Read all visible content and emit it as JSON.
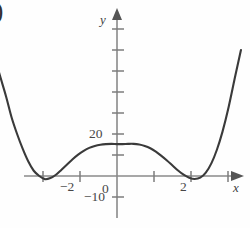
{
  "figure": {
    "paren_mark": ")",
    "background_color": "#fefefe",
    "curve_color": "#3a3a3a",
    "axis_color": "#8a8a8a",
    "text_color": "#474747"
  },
  "axes": {
    "y_label": "y",
    "x_label": "x",
    "origin_label": "0"
  },
  "ticks": {
    "y_labeled": [
      {
        "label": "20",
        "value": 20
      },
      {
        "label": "−10",
        "value": -10
      }
    ],
    "x_labeled": [
      {
        "label": "−2",
        "value": -2
      },
      {
        "label": "2",
        "value": 2
      }
    ]
  },
  "chart_data": {
    "type": "line",
    "title": "",
    "xlabel": "x",
    "ylabel": "y",
    "xlim": [
      -3.35,
      3.6
    ],
    "ylim": [
      -14,
      62
    ],
    "grid": false,
    "legend": "none",
    "x_ticks": [
      -3,
      -2,
      -1,
      0,
      1,
      2,
      3
    ],
    "x_tick_labels": [
      "",
      "−2",
      "",
      "0",
      "",
      "2",
      ""
    ],
    "y_ticks": [
      -10,
      0,
      10,
      20,
      30,
      40,
      50
    ],
    "y_tick_labels": [
      "−10",
      "",
      "",
      "20",
      "",
      "",
      ""
    ],
    "annotations": [
      "local maximum near x = 0.4, y ≈ 15",
      "local minima near x = −1.95 and x = 2.0, slightly below y = 0",
      "four x-intercepts near x = −2.25, −1.55, 1.6, 2.35"
    ],
    "series": [
      {
        "name": "quartic",
        "x": [
          -3.35,
          -3.2,
          -3.0,
          -2.85,
          -2.7,
          -2.55,
          -2.4,
          -2.25,
          -2.1,
          -1.95,
          -1.8,
          -1.65,
          -1.5,
          -1.35,
          -1.2,
          -1.05,
          -0.9,
          -0.75,
          -0.6,
          -0.45,
          -0.3,
          -0.15,
          0.0,
          0.15,
          0.3,
          0.45,
          0.6,
          0.75,
          0.9,
          1.05,
          1.2,
          1.35,
          1.5,
          1.65,
          1.8,
          1.95,
          2.1,
          2.25,
          2.4,
          2.55,
          2.7,
          2.85,
          3.0,
          3.2,
          3.35
        ],
        "y": [
          60.0,
          50.0,
          38.0,
          28.0,
          20.0,
          13.0,
          7.0,
          2.5,
          0.0,
          -1.5,
          -1.0,
          0.6,
          3.0,
          5.5,
          8.0,
          10.2,
          12.0,
          13.4,
          14.3,
          14.9,
          15.2,
          15.3,
          15.2,
          15.2,
          15.3,
          15.3,
          15.0,
          14.3,
          13.2,
          11.6,
          9.6,
          7.4,
          5.0,
          2.6,
          0.6,
          -0.8,
          -1.4,
          -0.8,
          1.6,
          6.0,
          12.5,
          21.0,
          31.5,
          48.0,
          60.0
        ]
      }
    ]
  }
}
